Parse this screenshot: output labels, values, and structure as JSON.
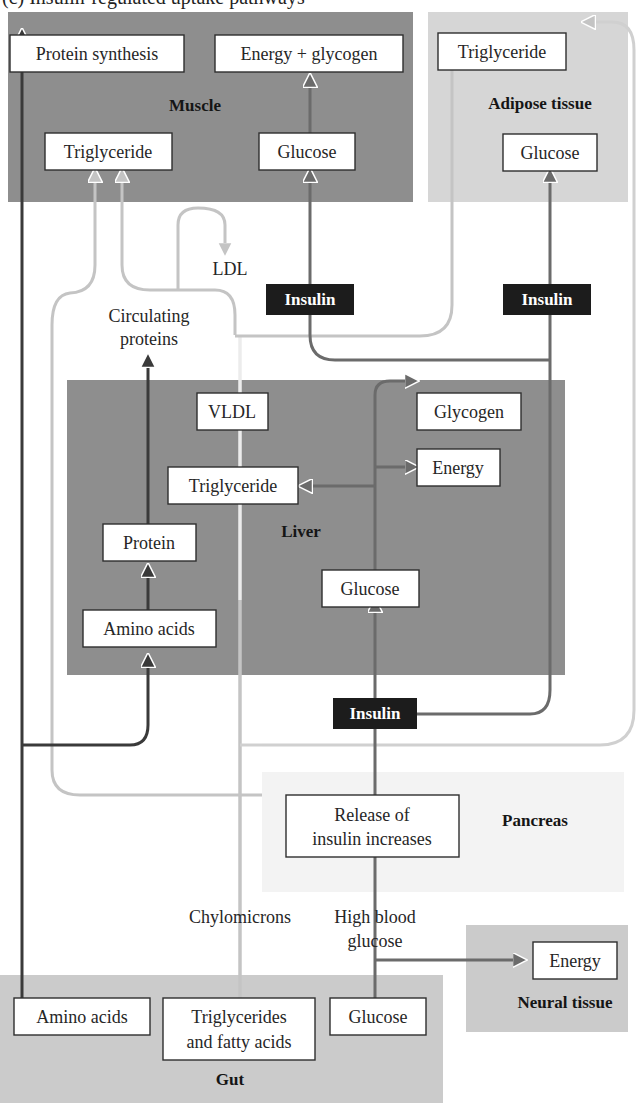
{
  "caption": "(c) Insulin-regulated uptake pathways",
  "colors": {
    "muscle_bg": "#8e8e8e",
    "liver_bg": "#8e8e8e",
    "adipose_bg": "#d6d6d6",
    "gut_bg": "#cbcbcb",
    "neural_bg": "#cbcbcb",
    "pancreas_bg": "#f3f3f3",
    "dark_line": "#3a3a3a",
    "mid_line": "#6b6b6b",
    "light_line": "#c4c4c4",
    "insulin_bg": "#1c1c1c"
  },
  "regions": {
    "muscle": {
      "label": "Muscle"
    },
    "adipose": {
      "label": "Adipose tissue"
    },
    "liver": {
      "label": "Liver"
    },
    "pancreas": {
      "label": "Pancreas"
    },
    "gut": {
      "label": "Gut"
    },
    "neural": {
      "label": "Neural tissue"
    }
  },
  "nodes": {
    "muscle_protein_synthesis": "Protein synthesis",
    "muscle_energy_glycogen": "Energy + glycogen",
    "muscle_triglyceride": "Triglyceride",
    "muscle_glucose": "Glucose",
    "adipose_triglyceride": "Triglyceride",
    "adipose_glucose": "Glucose",
    "liver_vldl": "VLDL",
    "liver_triglyceride": "Triglyceride",
    "liver_glycogen": "Glycogen",
    "liver_energy": "Energy",
    "liver_protein": "Protein",
    "liver_amino_acids": "Amino acids",
    "liver_glucose": "Glucose",
    "pancreas_release": [
      "Release of",
      "insulin increases"
    ],
    "gut_amino_acids": "Amino acids",
    "gut_triglycerides": [
      "Triglycerides",
      "and fatty acids"
    ],
    "gut_glucose": "Glucose",
    "neural_energy": "Energy"
  },
  "free_labels": {
    "ldl": "LDL",
    "circulating_proteins": [
      "Circulating",
      "proteins"
    ],
    "chylomicrons": "Chylomicrons",
    "high_blood_glucose": [
      "High blood",
      "glucose"
    ]
  },
  "insulin_tags": {
    "muscle": "Insulin",
    "adipose": "Insulin",
    "liver": "Insulin"
  }
}
